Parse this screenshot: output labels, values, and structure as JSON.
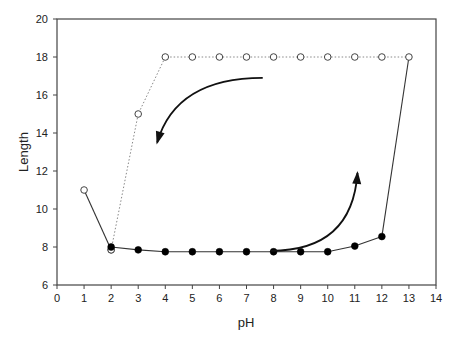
{
  "chart_data": {
    "type": "line",
    "title": "",
    "xlabel": "pH",
    "ylabel": "Length",
    "xlim": [
      0,
      14
    ],
    "ylim": [
      6,
      20
    ],
    "xticks": [
      0,
      1,
      2,
      3,
      4,
      5,
      6,
      7,
      8,
      9,
      10,
      11,
      12,
      13,
      14
    ],
    "yticks": [
      6,
      8,
      10,
      12,
      14,
      16,
      18,
      20
    ],
    "grid": false,
    "legend": "none",
    "series": [
      {
        "name": "descending-open-solid",
        "marker": "open-circle",
        "line": "solid",
        "x": [
          1,
          2
        ],
        "y": [
          11,
          7.85
        ]
      },
      {
        "name": "ascending-filled-solid",
        "marker": "filled-circle",
        "line": "solid",
        "x": [
          2,
          3,
          4,
          5,
          6,
          7,
          8,
          9,
          10,
          11,
          12
        ],
        "y": [
          8.0,
          7.85,
          7.75,
          7.75,
          7.75,
          7.75,
          7.75,
          7.75,
          7.75,
          8.05,
          8.55
        ]
      },
      {
        "name": "connector-solid",
        "marker": "none",
        "line": "solid",
        "x": [
          12,
          13
        ],
        "y": [
          8.55,
          18
        ]
      },
      {
        "name": "descending-open-dotted",
        "marker": "open-circle",
        "line": "dotted",
        "x": [
          2,
          3,
          4,
          5,
          6,
          7,
          8,
          9,
          10,
          11,
          12,
          13
        ],
        "y": [
          7.85,
          15,
          18,
          18,
          18,
          18,
          18,
          18,
          18,
          18,
          18,
          18
        ]
      }
    ],
    "annotations": [
      {
        "type": "arrow",
        "direction": "decreasing pH",
        "from": [
          7.6,
          16.9
        ],
        "via": [
          4.5,
          16.4
        ],
        "to": [
          3.7,
          13.5
        ]
      },
      {
        "type": "arrow",
        "direction": "increasing pH",
        "from": [
          7.9,
          7.8
        ],
        "via": [
          10.5,
          8.0
        ],
        "to": [
          11.1,
          11.9
        ]
      }
    ]
  }
}
